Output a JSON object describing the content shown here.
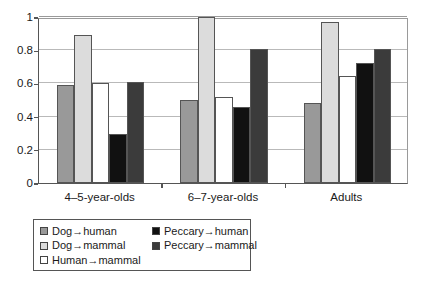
{
  "chart_data": {
    "type": "bar",
    "title": "",
    "xlabel": "",
    "ylabel": "",
    "categories": [
      "4–5-year-olds",
      "6–7-year-olds",
      "Adults"
    ],
    "ylim": [
      0,
      1
    ],
    "yticks": [
      "0",
      "0.2",
      "0.4",
      "0.6",
      "0.8",
      "1"
    ],
    "ytick_values": [
      0,
      0.2,
      0.4,
      0.6,
      0.8,
      1
    ],
    "grid": true,
    "legend_position": "below-left",
    "series": [
      {
        "name": "Dog→human",
        "color": "#999999",
        "values": [
          0.59,
          0.5,
          0.48
        ]
      },
      {
        "name": "Dog→mammal",
        "color": "#dcdcdc",
        "values": [
          0.89,
          1.0,
          0.97
        ]
      },
      {
        "name": "Human→mammal",
        "color": "#ffffff",
        "values": [
          0.605,
          0.52,
          0.645
        ]
      },
      {
        "name": "Peccary→human",
        "color": "#111111",
        "values": [
          0.295,
          0.455,
          0.725
        ]
      },
      {
        "name": "Peccary→mammal",
        "color": "#3b3b3b",
        "values": [
          0.61,
          0.81,
          0.81
        ]
      }
    ]
  },
  "legend": {
    "columns": [
      {
        "entries": [
          {
            "label": "Dog→human",
            "swatch": "#999999"
          },
          {
            "label": "Dog→mammal",
            "swatch": "#dcdcdc"
          },
          {
            "label": "Human→mammal",
            "swatch": "#ffffff"
          }
        ]
      },
      {
        "entries": [
          {
            "label": "Peccary→human",
            "swatch": "#111111"
          },
          {
            "label": "Peccary→mammal",
            "swatch": "#3b3b3b"
          }
        ]
      }
    ]
  }
}
